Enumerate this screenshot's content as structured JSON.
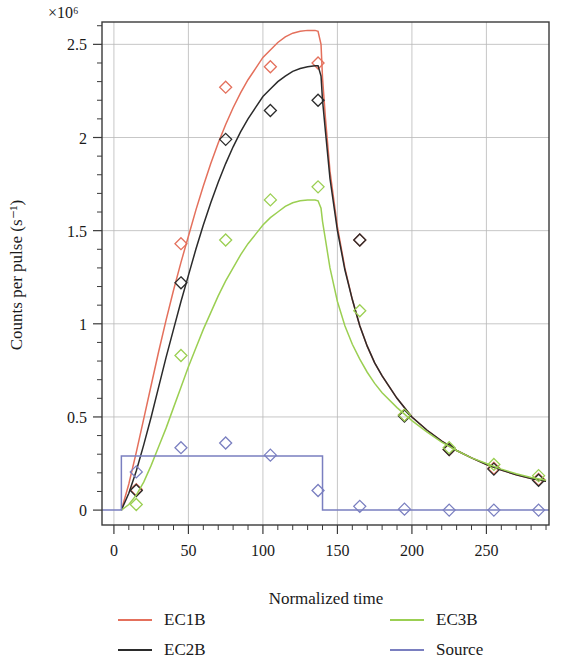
{
  "chart_data": {
    "type": "line",
    "title": "",
    "xlabel": "Normalized time",
    "ylabel": "Counts per pulse (s⁻¹)",
    "y_multiplier": "×10⁶",
    "xlim": [
      -8,
      292
    ],
    "ylim": [
      -0.08,
      2.62
    ],
    "xticks": [
      0,
      50,
      100,
      150,
      200,
      250
    ],
    "xtick_labels": [
      "0",
      "50",
      "100",
      "150",
      "200",
      "250"
    ],
    "yticks": [
      0,
      0.5,
      1,
      1.5,
      2,
      2.5
    ],
    "ytick_labels": [
      "0",
      "0.5",
      "1",
      "1.5",
      "2",
      "2.5"
    ],
    "x_minor_step": 10,
    "y_minor_step": 0.1,
    "grid": true,
    "legend_position": "below",
    "series": [
      {
        "name": "EC1B",
        "color": "#e4705c",
        "style": "line+markers",
        "marker": "diamond",
        "fit_x": [
          5,
          10,
          15,
          20,
          25,
          30,
          35,
          40,
          45,
          50,
          55,
          60,
          65,
          70,
          75,
          80,
          85,
          90,
          95,
          100,
          105,
          110,
          115,
          120,
          125,
          130,
          135,
          137,
          139,
          140,
          142,
          145,
          150,
          155,
          160,
          165,
          170,
          175,
          180,
          190,
          200,
          210,
          220,
          230,
          240,
          250,
          260,
          270,
          280,
          290
        ],
        "fit_y": [
          0.0,
          0.14,
          0.31,
          0.49,
          0.67,
          0.85,
          1.02,
          1.18,
          1.33,
          1.47,
          1.61,
          1.74,
          1.86,
          1.97,
          2.07,
          2.16,
          2.24,
          2.31,
          2.37,
          2.43,
          2.47,
          2.51,
          2.54,
          2.56,
          2.57,
          2.575,
          2.575,
          2.57,
          2.5,
          2.32,
          2.1,
          1.82,
          1.52,
          1.3,
          1.13,
          0.99,
          0.88,
          0.79,
          0.72,
          0.6,
          0.5,
          0.43,
          0.37,
          0.32,
          0.28,
          0.245,
          0.215,
          0.19,
          0.17,
          0.155
        ],
        "points_x": [
          15,
          45,
          75,
          105,
          137,
          165,
          195,
          225,
          255,
          285
        ],
        "points_y": [
          0.11,
          1.43,
          2.27,
          2.38,
          2.4,
          1.45,
          0.51,
          0.325,
          0.225,
          0.165
        ]
      },
      {
        "name": "EC2B",
        "color": "#2b2b2b",
        "style": "line+markers",
        "marker": "diamond",
        "fit_x": [
          5,
          10,
          15,
          20,
          25,
          30,
          35,
          40,
          45,
          50,
          55,
          60,
          65,
          70,
          75,
          80,
          85,
          90,
          95,
          100,
          105,
          110,
          115,
          120,
          125,
          130,
          135,
          137,
          139,
          140,
          142,
          145,
          150,
          155,
          160,
          165,
          170,
          175,
          180,
          190,
          200,
          210,
          220,
          230,
          240,
          250,
          260,
          270,
          280,
          290
        ],
        "fit_y": [
          0.0,
          0.09,
          0.21,
          0.35,
          0.5,
          0.66,
          0.82,
          0.97,
          1.12,
          1.26,
          1.4,
          1.53,
          1.65,
          1.76,
          1.86,
          1.95,
          2.03,
          2.1,
          2.16,
          2.22,
          2.26,
          2.3,
          2.33,
          2.355,
          2.37,
          2.38,
          2.385,
          2.385,
          2.33,
          2.2,
          2.03,
          1.78,
          1.5,
          1.29,
          1.13,
          0.99,
          0.88,
          0.79,
          0.72,
          0.6,
          0.5,
          0.43,
          0.37,
          0.32,
          0.28,
          0.245,
          0.215,
          0.19,
          0.17,
          0.155
        ],
        "points_x": [
          15,
          45,
          75,
          105,
          137,
          165,
          195,
          225,
          255,
          285
        ],
        "points_y": [
          0.105,
          1.22,
          1.99,
          2.145,
          2.2,
          1.45,
          0.505,
          0.325,
          0.22,
          0.16
        ]
      },
      {
        "name": "EC3B",
        "color": "#9bcf52",
        "style": "line+markers",
        "marker": "diamond",
        "fit_x": [
          5,
          10,
          15,
          20,
          25,
          30,
          35,
          40,
          45,
          50,
          55,
          60,
          65,
          70,
          75,
          80,
          85,
          90,
          95,
          100,
          105,
          110,
          115,
          120,
          125,
          130,
          135,
          137,
          139,
          140,
          142,
          145,
          150,
          155,
          160,
          165,
          170,
          175,
          180,
          190,
          200,
          210,
          220,
          230,
          240,
          250,
          260,
          270,
          280,
          290
        ],
        "fit_y": [
          0.0,
          0.03,
          0.08,
          0.15,
          0.24,
          0.34,
          0.44,
          0.55,
          0.66,
          0.77,
          0.87,
          0.97,
          1.06,
          1.15,
          1.23,
          1.3,
          1.37,
          1.43,
          1.48,
          1.53,
          1.57,
          1.6,
          1.63,
          1.65,
          1.66,
          1.665,
          1.665,
          1.66,
          1.62,
          1.55,
          1.45,
          1.3,
          1.12,
          0.99,
          0.89,
          0.81,
          0.74,
          0.68,
          0.63,
          0.55,
          0.48,
          0.42,
          0.365,
          0.32,
          0.28,
          0.25,
          0.22,
          0.195,
          0.175,
          0.16
        ],
        "points_x": [
          15,
          45,
          75,
          105,
          137,
          165,
          195,
          225,
          255,
          285
        ],
        "points_y": [
          0.03,
          0.83,
          1.45,
          1.665,
          1.735,
          1.07,
          0.51,
          0.335,
          0.245,
          0.185
        ]
      },
      {
        "name": "Source",
        "color": "#7a7fc0",
        "style": "step+markers",
        "marker": "diamond",
        "fit_x": [
          -8,
          5,
          5,
          140,
          140,
          292
        ],
        "fit_y": [
          0.0,
          0.0,
          0.29,
          0.29,
          0.0,
          0.0
        ],
        "points_x": [
          15,
          45,
          75,
          105,
          137,
          165,
          195,
          225,
          255,
          285
        ],
        "points_y": [
          0.205,
          0.335,
          0.36,
          0.295,
          0.105,
          0.02,
          0.005,
          0.0,
          0.0,
          0.0
        ]
      }
    ]
  },
  "legend": {
    "items": [
      {
        "label": "EC1B",
        "color": "#e4705c"
      },
      {
        "label": "EC2B",
        "color": "#2b2b2b"
      },
      {
        "label": "EC3B",
        "color": "#9bcf52"
      },
      {
        "label": "Source",
        "color": "#7a7fc0"
      }
    ]
  }
}
